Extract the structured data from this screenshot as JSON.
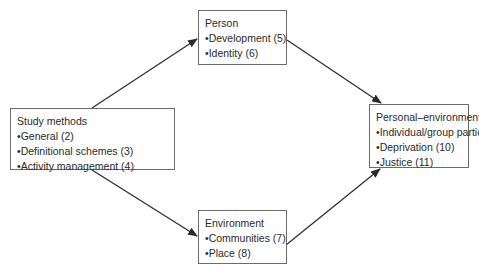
{
  "nodes": {
    "study": {
      "title": "Study methods",
      "items": [
        "General (2)",
        "Definitional schemes (3)",
        "Activity management (4)"
      ]
    },
    "person": {
      "title": "Person",
      "items": [
        "Development (5)",
        "Identity (6)"
      ]
    },
    "environment": {
      "title": "Environment",
      "items": [
        "Communities (7)",
        "Place (8)"
      ]
    },
    "interaction": {
      "title": "Personal–environment interaction",
      "items": [
        "Individual/group participation (9)",
        "Deprivation (10)",
        "Justice (11)"
      ]
    }
  },
  "edges": [
    {
      "from": "study",
      "to": "person"
    },
    {
      "from": "study",
      "to": "environment"
    },
    {
      "from": "person",
      "to": "interaction"
    },
    {
      "from": "environment",
      "to": "interaction"
    }
  ],
  "colors": {
    "line": "#2a2a2a",
    "border": "#6b6b6b"
  }
}
